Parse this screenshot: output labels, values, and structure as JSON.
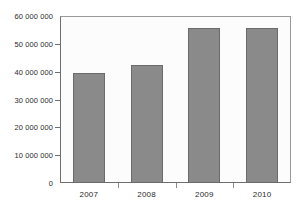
{
  "chart_data": {
    "type": "bar",
    "title": "",
    "xlabel": "",
    "ylabel": "",
    "categories": [
      "2007",
      "2008",
      "2009",
      "2010"
    ],
    "values": [
      39700000,
      42500000,
      55700000,
      55700000
    ],
    "ylim": [
      0,
      60000000
    ],
    "ytick_values": [
      0,
      10000000,
      20000000,
      30000000,
      40000000,
      50000000,
      60000000
    ],
    "ytick_labels": [
      "0",
      "10 000 000",
      "20 000 000",
      "30 000 000",
      "40 000 000",
      "50 000 000",
      "60 000 000"
    ],
    "grid": false,
    "legend": null,
    "series_color": "#8a8a8a",
    "series_border_color": "#6b6b6b",
    "plot_background": "#fcfcfc",
    "axis_color": "#6e6e6e"
  }
}
